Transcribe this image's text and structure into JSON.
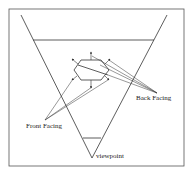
{
  "diagram": {
    "type": "view-frustum-backface-culling",
    "colors": {
      "line": "#333333",
      "frame": "#555555",
      "background": "#ffffff"
    },
    "labels": {
      "back_facing": "Back Facing",
      "front_facing": "Front Facing",
      "viewpoint": "viewpoint"
    }
  }
}
